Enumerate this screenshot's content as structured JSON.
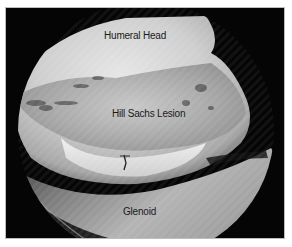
{
  "image": {
    "description": "Arthroscopic view of shoulder joint",
    "labels": {
      "humeral_head": "Humeral Head",
      "hill_sachs_lesion": "Hill Sachs Lesion",
      "glenoid": "Glenoid"
    },
    "colors": {
      "background": "#050505",
      "frame_border": "#bdbdbd",
      "page": "#ffffff",
      "label_text": "#1a1a1a"
    }
  }
}
